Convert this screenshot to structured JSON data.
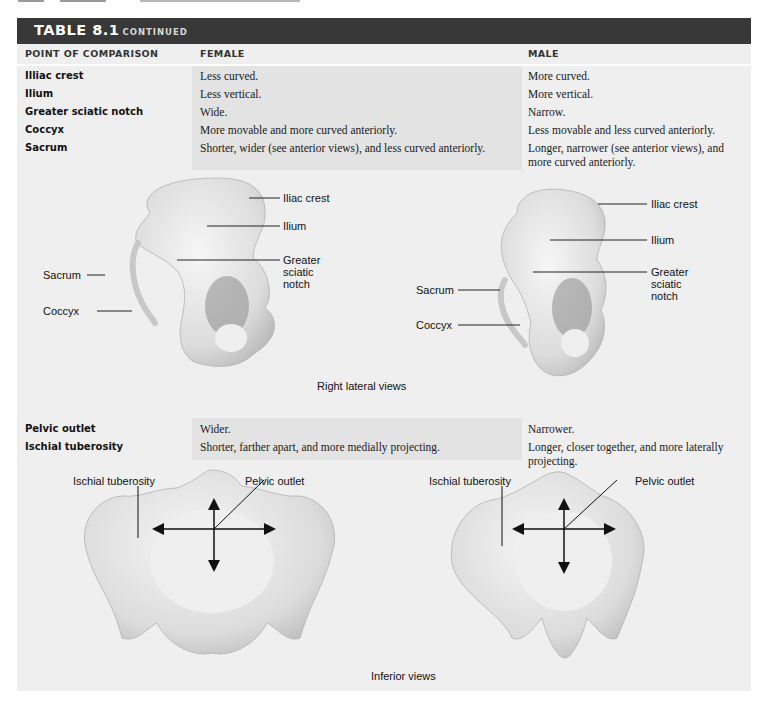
{
  "table": {
    "title": "TABLE 8.1",
    "title_suffix": "CONTINUED",
    "columns": [
      "POINT OF COMPARISON",
      "FEMALE",
      "MALE"
    ],
    "rows_top": [
      {
        "point": "Illiac crest",
        "female": "Less curved.",
        "male": "More curved."
      },
      {
        "point": "Ilium",
        "female": "Less vertical.",
        "male": "More vertical."
      },
      {
        "point": "Greater sciatic notch",
        "female": "Wide.",
        "male": "Narrow."
      },
      {
        "point": "Coccyx",
        "female": "More movable and more curved anteriorly.",
        "male": "Less movable and less curved anteriorly."
      },
      {
        "point": "Sacrum",
        "female": "Shorter, wider (see anterior views), and less curved anteriorly.",
        "male": "Longer, narrower (see anterior views), and more curved anteriorly."
      }
    ],
    "rows_bottom": [
      {
        "point": "Pelvic outlet",
        "female": "Wider.",
        "male": "Narrower."
      },
      {
        "point": "Ischial tuberosity",
        "female": "Shorter, farther apart, and more medially projecting.",
        "male": "Longer, closer together, and more laterally projecting."
      }
    ]
  },
  "figures": {
    "lateral": {
      "female_labels": {
        "iliac_crest": "Iliac crest",
        "ilium": "Ilium",
        "greater_sciatic_notch": [
          "Greater",
          "sciatic",
          "notch"
        ],
        "sacrum": "Sacrum",
        "coccyx": "Coccyx"
      },
      "male_labels": {
        "iliac_crest": "Iliac crest",
        "ilium": "Ilium",
        "greater_sciatic_notch": [
          "Greater",
          "sciatic",
          "notch"
        ],
        "sacrum": "Sacrum",
        "coccyx": "Coccyx"
      },
      "caption": "Right lateral views"
    },
    "inferior": {
      "female_labels": {
        "ischial_tuberosity": "Ischial tuberosity",
        "pelvic_outlet": "Pelvic outlet"
      },
      "male_labels": {
        "ischial_tuberosity": "Ischial tuberosity",
        "pelvic_outlet": "Pelvic outlet"
      },
      "caption": "Inferior views"
    }
  },
  "colors": {
    "title_bar": "#383838",
    "panel": "#efefef",
    "female_shade": "#e3e3e3"
  }
}
